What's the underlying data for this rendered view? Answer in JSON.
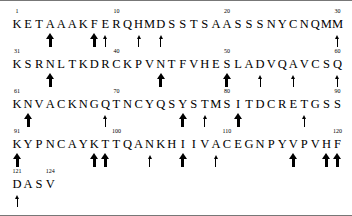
{
  "figure": {
    "title": "",
    "type": "protein-sequence-annotation",
    "font_color": "#000000",
    "background": "#ffffff",
    "border_color": "#777777",
    "residues_per_row": 30,
    "sequence_length": 124,
    "sequence": "KETAAAKFERQHMDSSTSAASSSNYCNQMMKSRNLTKDRCKPVNTFVHESLADVQAVCSQKNVACKNGQTNCYQSYSTMSITDCRETGSSKYPNCAYKTTQANKHIIVACEGNPYVPVHFDASV"
  },
  "rows": [
    {
      "start": 1,
      "residues": [
        "K",
        "E",
        "T",
        "A",
        "A",
        "A",
        "K",
        "F",
        "E",
        "R",
        "Q",
        "H",
        "M",
        "D",
        "S",
        "S",
        "T",
        "S",
        "A",
        "A",
        "S",
        "S",
        "S",
        "N",
        "Y",
        "C",
        "N",
        "Q",
        "M",
        "M"
      ],
      "numbers": [
        {
          "label": "1",
          "index": 1
        },
        {
          "label": "10",
          "index": 10
        },
        {
          "label": "20",
          "index": 20
        },
        {
          "label": "30",
          "index": 30
        }
      ],
      "arrows_below": [
        {
          "index": 4,
          "size": "big"
        },
        {
          "index": 8,
          "size": "big"
        },
        {
          "index": 9,
          "size": "small"
        },
        {
          "index": 12,
          "size": "small"
        },
        {
          "index": 14,
          "size": "small"
        },
        {
          "index": 30,
          "size": "small"
        }
      ]
    },
    {
      "start": 31,
      "residues": [
        "K",
        "S",
        "R",
        "N",
        "L",
        "T",
        "K",
        "D",
        "R",
        "C",
        "K",
        "P",
        "V",
        "N",
        "T",
        "F",
        "V",
        "H",
        "E",
        "S",
        "L",
        "A",
        "D",
        "V",
        "Q",
        "A",
        "V",
        "C",
        "S",
        "Q"
      ],
      "numbers": [
        {
          "label": "31",
          "index": 31
        },
        {
          "label": "40",
          "index": 40
        },
        {
          "label": "50",
          "index": 50
        },
        {
          "label": "60",
          "index": 60
        }
      ],
      "arrows_below": [
        {
          "index": 34,
          "size": "big"
        },
        {
          "index": 44,
          "size": "big"
        },
        {
          "index": 50,
          "size": "big"
        },
        {
          "index": 53,
          "size": "small"
        },
        {
          "index": 56,
          "size": "small"
        },
        {
          "index": 60,
          "size": "small"
        }
      ]
    },
    {
      "start": 61,
      "residues": [
        "K",
        "N",
        "V",
        "A",
        "C",
        "K",
        "N",
        "G",
        "Q",
        "T",
        "N",
        "C",
        "Y",
        "Q",
        "S",
        "Y",
        "S",
        "T",
        "M",
        "S",
        "I",
        "T",
        "D",
        "C",
        "R",
        "E",
        "T",
        "G",
        "S",
        "S"
      ],
      "numbers": [
        {
          "label": "61",
          "index": 61
        },
        {
          "label": "70",
          "index": 70
        },
        {
          "label": "80",
          "index": 80
        },
        {
          "label": "90",
          "index": 90
        }
      ],
      "arrows_below": [
        {
          "index": 62,
          "size": "big"
        },
        {
          "index": 69,
          "size": "small"
        },
        {
          "index": 76,
          "size": "big"
        },
        {
          "index": 78,
          "size": "small"
        },
        {
          "index": 81,
          "size": "big"
        },
        {
          "index": 87,
          "size": "small"
        }
      ]
    },
    {
      "start": 91,
      "residues": [
        "K",
        "Y",
        "P",
        "N",
        "C",
        "A",
        "Y",
        "K",
        "T",
        "T",
        "Q",
        "A",
        "N",
        "K",
        "H",
        "I",
        "I",
        "V",
        "A",
        "C",
        "E",
        "G",
        "N",
        "P",
        "Y",
        "V",
        "P",
        "V",
        "H",
        "F"
      ],
      "numbers": [
        {
          "label": "91",
          "index": 91
        },
        {
          "label": "100",
          "index": 100
        },
        {
          "label": "110",
          "index": 110
        },
        {
          "label": "120",
          "index": 120
        }
      ],
      "arrows_below": [
        {
          "index": 91,
          "size": "big"
        },
        {
          "index": 98,
          "size": "big"
        },
        {
          "index": 99,
          "size": "big"
        },
        {
          "index": 103,
          "size": "small"
        },
        {
          "index": 106,
          "size": "big"
        },
        {
          "index": 109,
          "size": "small"
        },
        {
          "index": 116,
          "size": "big"
        },
        {
          "index": 119,
          "size": "big"
        },
        {
          "index": 120,
          "size": "big"
        }
      ]
    },
    {
      "start": 121,
      "residues": [
        "D",
        "A",
        "S",
        "V"
      ],
      "numbers": [
        {
          "label": "121",
          "index": 121
        },
        {
          "label": "124",
          "index": 124
        }
      ],
      "arrows_below": [
        {
          "index": 121,
          "size": "small"
        }
      ]
    }
  ]
}
